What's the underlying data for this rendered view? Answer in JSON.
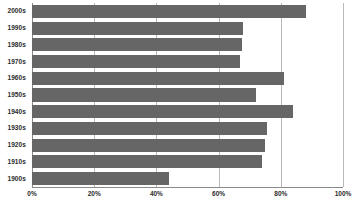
{
  "chart_data": {
    "type": "bar",
    "orientation": "horizontal",
    "title": "",
    "subtitle": "",
    "xlabel": "",
    "ylabel": "",
    "xlim": [
      0,
      100
    ],
    "grid": true,
    "legend": false,
    "legend_position": "none",
    "bar_color": "#666666",
    "gridline_color": "#b9b9b9",
    "axis_color": "#8a8a8a",
    "categories": [
      "2000s",
      "1990s",
      "1980s",
      "1970s",
      "1960s",
      "1950s",
      "1940s",
      "1930s",
      "1920s",
      "1910s",
      "1900s"
    ],
    "values": [
      88,
      68,
      67.5,
      67,
      81,
      72,
      84,
      75.5,
      75,
      74,
      44
    ],
    "xticks": [
      0,
      20,
      40,
      60,
      80,
      100
    ],
    "xticklabels": [
      "0%",
      "20%",
      "40%",
      "60%",
      "80%",
      "100%"
    ]
  }
}
